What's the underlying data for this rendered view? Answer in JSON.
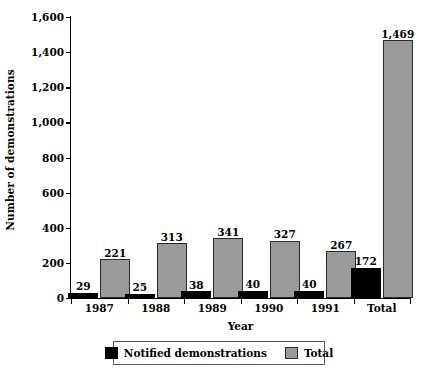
{
  "chart_data": {
    "type": "bar",
    "title": "",
    "subtitle": "",
    "xlabel": "Year",
    "ylabel": "Number of demonstrations",
    "categories": [
      "1987",
      "1988",
      "1989",
      "1990",
      "1991",
      "Total"
    ],
    "series": [
      {
        "name": "Notified demonstrations",
        "color": "#000000",
        "values": [
          29,
          25,
          38,
          40,
          40,
          172
        ],
        "labels": [
          "29",
          "25",
          "38",
          "40",
          "40",
          "172"
        ]
      },
      {
        "name": "Total",
        "color": "#9a9a9a",
        "values": [
          221,
          313,
          341,
          327,
          267,
          1469
        ],
        "labels": [
          "221",
          "313",
          "341",
          "327",
          "267",
          "1,469"
        ]
      }
    ],
    "ylim": [
      0,
      1600
    ],
    "ytick_values": [
      0,
      200,
      400,
      600,
      800,
      1000,
      1200,
      1400,
      1600
    ],
    "ytick_labels": [
      "0",
      "200",
      "400",
      "600",
      "800",
      "1,000",
      "1,200",
      "1,400",
      "1,600"
    ],
    "grid": false,
    "legend_position": "bottom",
    "legend_entries": [
      "Notified demonstrations",
      "Total"
    ]
  }
}
